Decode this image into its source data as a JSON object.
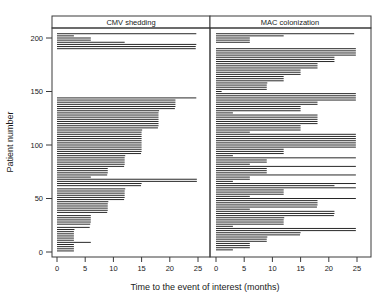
{
  "figure": {
    "width": 387,
    "height": 298,
    "background": "#ffffff",
    "ink_color": "#000000",
    "frame_color": "#3a3a3a"
  },
  "axes": {
    "x_title": "Time to the event of interest (months)",
    "y_title": "Patient number",
    "x_ticks": [
      0,
      5,
      10,
      15,
      20,
      25
    ],
    "x_tick_labels": [
      "0",
      "5",
      "10",
      "15",
      "20",
      "25"
    ],
    "y_ticks": [
      0,
      50,
      100,
      150,
      200
    ],
    "y_tick_labels": [
      "0",
      "50",
      "100",
      "150",
      "200"
    ],
    "xlim": [
      0,
      26
    ],
    "ylim": [
      0,
      212
    ]
  },
  "panels": [
    {
      "id": "cmv",
      "label": "CMV shedding"
    },
    {
      "id": "mac",
      "label": "MAC colonization"
    }
  ],
  "chart_data": {
    "type": "bar",
    "orientation": "horizontal",
    "title": "",
    "xlabel": "Time to the event of interest (months)",
    "ylabel": "Patient number",
    "xlim": [
      0,
      26
    ],
    "ylim": [
      0,
      212
    ],
    "grid": false,
    "legend": null,
    "series": [
      {
        "name": "CMV shedding",
        "panel": "cmv",
        "unit": "months",
        "points": [
          {
            "y": 1,
            "x": 3.0
          },
          {
            "y": 3,
            "x": 3.0
          },
          {
            "y": 5,
            "x": 3.0
          },
          {
            "y": 7,
            "x": 3.0
          },
          {
            "y": 9,
            "x": 6.0
          },
          {
            "y": 11,
            "x": 3.0
          },
          {
            "y": 13,
            "x": 3.0
          },
          {
            "y": 15,
            "x": 3.0
          },
          {
            "y": 17,
            "x": 3.0
          },
          {
            "y": 19,
            "x": 3.0
          },
          {
            "y": 21,
            "x": 3.1
          },
          {
            "y": 23,
            "x": 5.8
          },
          {
            "y": 26,
            "x": 5.9
          },
          {
            "y": 28,
            "x": 6.0
          },
          {
            "y": 30,
            "x": 6.0
          },
          {
            "y": 32,
            "x": 6.0
          },
          {
            "y": 34,
            "x": 6.0
          },
          {
            "y": 37,
            "x": 8.9
          },
          {
            "y": 39,
            "x": 9.0
          },
          {
            "y": 41,
            "x": 9.0
          },
          {
            "y": 43,
            "x": 9.0
          },
          {
            "y": 45,
            "x": 9.0
          },
          {
            "y": 47,
            "x": 9.1
          },
          {
            "y": 49,
            "x": 11.9
          },
          {
            "y": 51,
            "x": 12.0
          },
          {
            "y": 53,
            "x": 12.0
          },
          {
            "y": 55,
            "x": 12.0
          },
          {
            "y": 57,
            "x": 12.0
          },
          {
            "y": 59,
            "x": 12.1
          },
          {
            "y": 62,
            "x": 14.9
          },
          {
            "y": 64,
            "x": 15.0
          },
          {
            "y": 66,
            "x": 24.8
          },
          {
            "y": 68,
            "x": 24.8
          },
          {
            "y": 70,
            "x": 6.0
          },
          {
            "y": 72,
            "x": 8.9
          },
          {
            "y": 74,
            "x": 9.0
          },
          {
            "y": 76,
            "x": 9.0
          },
          {
            "y": 78,
            "x": 9.0
          },
          {
            "y": 80,
            "x": 11.9
          },
          {
            "y": 82,
            "x": 12.0
          },
          {
            "y": 84,
            "x": 12.0
          },
          {
            "y": 86,
            "x": 12.0
          },
          {
            "y": 88,
            "x": 12.0
          },
          {
            "y": 90,
            "x": 12.1
          },
          {
            "y": 92,
            "x": 14.9
          },
          {
            "y": 94,
            "x": 15.0
          },
          {
            "y": 96,
            "x": 15.0
          },
          {
            "y": 98,
            "x": 15.0
          },
          {
            "y": 100,
            "x": 15.0
          },
          {
            "y": 102,
            "x": 15.0
          },
          {
            "y": 104,
            "x": 15.0
          },
          {
            "y": 106,
            "x": 15.0
          },
          {
            "y": 108,
            "x": 15.0
          },
          {
            "y": 110,
            "x": 15.0
          },
          {
            "y": 112,
            "x": 15.0
          },
          {
            "y": 114,
            "x": 15.1
          },
          {
            "y": 116,
            "x": 17.9
          },
          {
            "y": 118,
            "x": 18.0
          },
          {
            "y": 120,
            "x": 18.0
          },
          {
            "y": 122,
            "x": 18.0
          },
          {
            "y": 124,
            "x": 18.0
          },
          {
            "y": 126,
            "x": 18.0
          },
          {
            "y": 128,
            "x": 18.0
          },
          {
            "y": 130,
            "x": 18.0
          },
          {
            "y": 132,
            "x": 18.1
          },
          {
            "y": 134,
            "x": 20.9
          },
          {
            "y": 136,
            "x": 21.0
          },
          {
            "y": 138,
            "x": 21.0
          },
          {
            "y": 140,
            "x": 21.0
          },
          {
            "y": 142,
            "x": 21.0
          },
          {
            "y": 144,
            "x": 24.7
          },
          {
            "y": 190,
            "x": 24.6
          },
          {
            "y": 192,
            "x": 24.6
          },
          {
            "y": 194,
            "x": 24.7
          },
          {
            "y": 196,
            "x": 12.0
          },
          {
            "y": 198,
            "x": 6.0
          },
          {
            "y": 200,
            "x": 6.0
          },
          {
            "y": 202,
            "x": 3.0
          },
          {
            "y": 204,
            "x": 24.7
          }
        ]
      },
      {
        "name": "MAC colonization",
        "panel": "mac",
        "unit": "months",
        "points": [
          {
            "y": 2,
            "x": 3.0
          },
          {
            "y": 4,
            "x": 6.0
          },
          {
            "y": 6,
            "x": 6.0
          },
          {
            "y": 8,
            "x": 6.0
          },
          {
            "y": 10,
            "x": 9.0
          },
          {
            "y": 12,
            "x": 9.0
          },
          {
            "y": 14,
            "x": 9.1
          },
          {
            "y": 16,
            "x": 14.9
          },
          {
            "y": 18,
            "x": 15.0
          },
          {
            "y": 20,
            "x": 24.8
          },
          {
            "y": 22,
            "x": 24.8
          },
          {
            "y": 24,
            "x": 3.0
          },
          {
            "y": 26,
            "x": 12.0
          },
          {
            "y": 28,
            "x": 12.0
          },
          {
            "y": 30,
            "x": 12.0
          },
          {
            "y": 32,
            "x": 12.1
          },
          {
            "y": 34,
            "x": 20.9
          },
          {
            "y": 36,
            "x": 21.0
          },
          {
            "y": 38,
            "x": 21.0
          },
          {
            "y": 40,
            "x": 6.0
          },
          {
            "y": 42,
            "x": 17.9
          },
          {
            "y": 44,
            "x": 18.0
          },
          {
            "y": 46,
            "x": 18.0
          },
          {
            "y": 48,
            "x": 18.0
          },
          {
            "y": 50,
            "x": 24.8
          },
          {
            "y": 52,
            "x": 6.0
          },
          {
            "y": 54,
            "x": 12.0
          },
          {
            "y": 56,
            "x": 12.0
          },
          {
            "y": 58,
            "x": 12.0
          },
          {
            "y": 60,
            "x": 24.8
          },
          {
            "y": 62,
            "x": 21.0
          },
          {
            "y": 64,
            "x": 24.8
          },
          {
            "y": 66,
            "x": 3.0
          },
          {
            "y": 68,
            "x": 6.0
          },
          {
            "y": 70,
            "x": 6.0
          },
          {
            "y": 72,
            "x": 24.8
          },
          {
            "y": 74,
            "x": 9.0
          },
          {
            "y": 76,
            "x": 9.0
          },
          {
            "y": 78,
            "x": 9.0
          },
          {
            "y": 80,
            "x": 24.8
          },
          {
            "y": 82,
            "x": 6.0
          },
          {
            "y": 84,
            "x": 9.0
          },
          {
            "y": 86,
            "x": 9.0
          },
          {
            "y": 88,
            "x": 24.8
          },
          {
            "y": 90,
            "x": 3.0
          },
          {
            "y": 92,
            "x": 12.0
          },
          {
            "y": 94,
            "x": 12.0
          },
          {
            "y": 96,
            "x": 12.0
          },
          {
            "y": 98,
            "x": 24.8
          },
          {
            "y": 100,
            "x": 24.8
          },
          {
            "y": 102,
            "x": 24.8
          },
          {
            "y": 104,
            "x": 24.8
          },
          {
            "y": 106,
            "x": 24.8
          },
          {
            "y": 108,
            "x": 24.8
          },
          {
            "y": 110,
            "x": 24.8
          },
          {
            "y": 112,
            "x": 6.0
          },
          {
            "y": 114,
            "x": 15.0
          },
          {
            "y": 116,
            "x": 15.0
          },
          {
            "y": 118,
            "x": 15.0
          },
          {
            "y": 120,
            "x": 18.0
          },
          {
            "y": 122,
            "x": 18.0
          },
          {
            "y": 124,
            "x": 18.0
          },
          {
            "y": 126,
            "x": 18.0
          },
          {
            "y": 128,
            "x": 18.0
          },
          {
            "y": 130,
            "x": 3.0
          },
          {
            "y": 132,
            "x": 15.0
          },
          {
            "y": 134,
            "x": 15.0
          },
          {
            "y": 136,
            "x": 15.0
          },
          {
            "y": 138,
            "x": 18.0
          },
          {
            "y": 140,
            "x": 18.0
          },
          {
            "y": 142,
            "x": 24.8
          },
          {
            "y": 144,
            "x": 24.8
          },
          {
            "y": 146,
            "x": 24.8
          },
          {
            "y": 148,
            "x": 24.8
          },
          {
            "y": 150,
            "x": 1.0
          },
          {
            "y": 152,
            "x": 9.0
          },
          {
            "y": 154,
            "x": 9.0
          },
          {
            "y": 156,
            "x": 9.0
          },
          {
            "y": 158,
            "x": 9.1
          },
          {
            "y": 160,
            "x": 12.0
          },
          {
            "y": 162,
            "x": 12.0
          },
          {
            "y": 164,
            "x": 12.0
          },
          {
            "y": 166,
            "x": 15.0
          },
          {
            "y": 168,
            "x": 15.0
          },
          {
            "y": 170,
            "x": 15.0
          },
          {
            "y": 172,
            "x": 18.0
          },
          {
            "y": 174,
            "x": 18.0
          },
          {
            "y": 176,
            "x": 18.0
          },
          {
            "y": 178,
            "x": 21.0
          },
          {
            "y": 180,
            "x": 21.0
          },
          {
            "y": 182,
            "x": 21.0
          },
          {
            "y": 184,
            "x": 24.8
          },
          {
            "y": 186,
            "x": 24.8
          },
          {
            "y": 188,
            "x": 24.8
          },
          {
            "y": 190,
            "x": 24.8
          },
          {
            "y": 196,
            "x": 6.0
          },
          {
            "y": 198,
            "x": 6.0
          },
          {
            "y": 200,
            "x": 6.0
          },
          {
            "y": 202,
            "x": 12.0
          },
          {
            "y": 204,
            "x": 24.5
          }
        ]
      }
    ]
  }
}
